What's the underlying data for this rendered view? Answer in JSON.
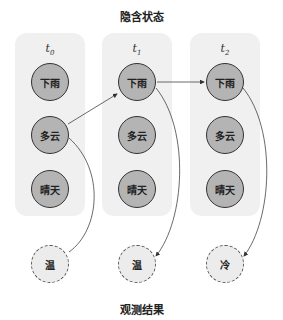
{
  "diagram": {
    "title_top": "隐含状态",
    "title_bottom": "观测结果",
    "time_steps": [
      {
        "label": "t",
        "sub": "0",
        "states": [
          "下雨",
          "多云",
          "晴天"
        ],
        "observation": "温"
      },
      {
        "label": "t",
        "sub": "1",
        "states": [
          "下雨",
          "多云",
          "晴天"
        ],
        "observation": "温"
      },
      {
        "label": "t",
        "sub": "2",
        "states": [
          "下雨",
          "多云",
          "晴天"
        ],
        "observation": "冷"
      }
    ],
    "transitions": [
      {
        "from": "t0.多云",
        "to": "t1.下雨"
      },
      {
        "from": "t1.下雨",
        "to": "t2.下雨"
      }
    ],
    "emissions": [
      {
        "from": "t0.多云",
        "to": "t0.温"
      },
      {
        "from": "t1.下雨",
        "to": "t1.温"
      },
      {
        "from": "t2.下雨",
        "to": "t2.冷"
      }
    ],
    "colors": {
      "panel": "#f0f0f0",
      "hidden_node": "#b4b4b4",
      "observed_node": "#ececec",
      "stroke": "#333333"
    }
  }
}
